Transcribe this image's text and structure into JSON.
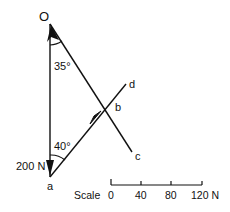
{
  "diagram": {
    "points": {
      "O": "O",
      "a": "a",
      "b": "b",
      "c": "c",
      "d": "d"
    },
    "angles": {
      "top": "35°",
      "bottom": "40°"
    },
    "force_label": "200 N",
    "scale": {
      "label": "Scale",
      "ticks": [
        "0",
        "40",
        "80",
        "120 N"
      ]
    },
    "colors": {
      "line": "#111111",
      "background": "#ffffff"
    }
  }
}
